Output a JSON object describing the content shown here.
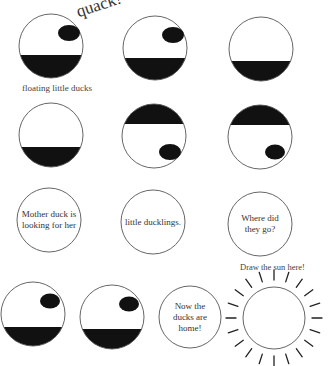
{
  "sound_effect": "quack!",
  "caption": "floating little ducks",
  "sun_prompt": "Draw the sun here!",
  "colors": {
    "ink": "#111111",
    "outline": "#555555",
    "paper": "#ffffff"
  },
  "panels": [
    {
      "id": 1,
      "cx": 51,
      "cy": 46,
      "r": 32,
      "water": "bottom",
      "duck": {
        "cx": 69,
        "cy": 33
      }
    },
    {
      "id": 2,
      "cx": 155,
      "cy": 48,
      "r": 32,
      "water": "bottom",
      "duck": {
        "cx": 173,
        "cy": 35
      }
    },
    {
      "id": 3,
      "cx": 261,
      "cy": 49,
      "r": 32,
      "water": "bottom",
      "duck": null
    },
    {
      "id": 4,
      "cx": 51,
      "cy": 135,
      "r": 32,
      "water": "bottom",
      "duck": null
    },
    {
      "id": 5,
      "cx": 154,
      "cy": 136,
      "r": 32,
      "water": "top",
      "duck": {
        "cx": 170,
        "cy": 152
      }
    },
    {
      "id": 6,
      "cx": 260,
      "cy": 137,
      "r": 32,
      "water": "top",
      "duck": {
        "cx": 275,
        "cy": 152
      }
    },
    {
      "id": 7,
      "cx": 49,
      "cy": 220,
      "r": 32,
      "text": "Mother duck is looking for her"
    },
    {
      "id": 8,
      "cx": 153,
      "cy": 222,
      "r": 32,
      "text": "little ducklings."
    },
    {
      "id": 9,
      "cx": 260,
      "cy": 224,
      "r": 32,
      "text": "Where did they go?"
    },
    {
      "id": 10,
      "cx": 33,
      "cy": 314,
      "r": 32,
      "water": "bottom",
      "duck": {
        "cx": 50,
        "cy": 301
      }
    },
    {
      "id": 11,
      "cx": 112,
      "cy": 317,
      "r": 32,
      "water": "bottom",
      "duck": {
        "cx": 129,
        "cy": 304
      }
    },
    {
      "id": 12,
      "cx": 190,
      "cy": 317,
      "r": 31,
      "text": "Now the ducks are home!"
    }
  ],
  "texts": {
    "panel7": "Mother duck is looking for her",
    "panel8": "little ducklings.",
    "panel9": "Where did they go?",
    "panel12": "Now the ducks are home!"
  },
  "sun": {
    "cx": 274,
    "cy": 318,
    "r": 31,
    "ray_inner": 38,
    "ray_outer": 48,
    "ray_count": 20
  }
}
